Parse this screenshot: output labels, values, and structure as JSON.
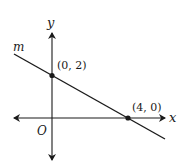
{
  "diagram": {
    "type": "coordinate-plane-line",
    "axes": {
      "x_label": "x",
      "y_label": "y",
      "origin_label": "O"
    },
    "line": {
      "label": "m",
      "equation_implied": "y = -x/2 + 2"
    },
    "points": [
      {
        "label": "(0, 2)",
        "x": 0,
        "y": 2
      },
      {
        "label": "(4, 0)",
        "x": 4,
        "y": 0
      }
    ],
    "colors": {
      "ink": "#1a1a1a",
      "background": "#ffffff"
    }
  }
}
